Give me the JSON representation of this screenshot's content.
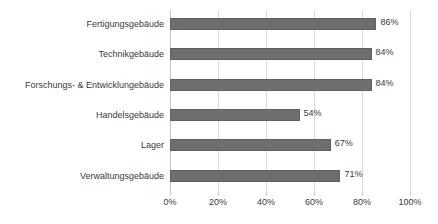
{
  "chart_data": {
    "type": "bar",
    "orientation": "horizontal",
    "title": "",
    "xlabel": "",
    "ylabel": "",
    "xlim": [
      0,
      100
    ],
    "xticks": [
      0,
      20,
      40,
      60,
      80,
      100
    ],
    "xtick_labels": [
      "0%",
      "20%",
      "40%",
      "60%",
      "80%",
      "100%"
    ],
    "grid": true,
    "legend": false,
    "value_suffix": "%",
    "bar_color": "#6e6e6e",
    "gridline_color": "#d9d9d9",
    "text_color": "#3a3a3a",
    "background_color": "#ffffff",
    "categories": [
      "Fertigungsgebäude",
      "Technikgebäude",
      "Forschungs- & Entwicklungebäude",
      "Handelsgebäude",
      "Lager",
      "Verwaltungsgebäude"
    ],
    "values": [
      86,
      84,
      84,
      54,
      67,
      71
    ],
    "value_labels": [
      "86%",
      "84%",
      "84%",
      "54%",
      "67%",
      "71%"
    ],
    "bars": [
      {
        "category": "Fertigungsgebäude",
        "value": 86,
        "label": "86%"
      },
      {
        "category": "Technikgebäude",
        "value": 84,
        "label": "84%"
      },
      {
        "category": "Forschungs- & Entwicklungebäude",
        "value": 84,
        "label": "84%"
      },
      {
        "category": "Handelsgebäude",
        "value": 54,
        "label": "54%"
      },
      {
        "category": "Lager",
        "value": 67,
        "label": "67%"
      },
      {
        "category": "Verwaltungsgebäude",
        "value": 71,
        "label": "71%"
      }
    ]
  }
}
